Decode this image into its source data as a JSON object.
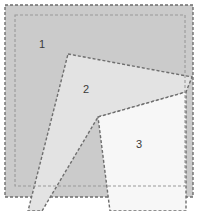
{
  "canvas": {
    "width": 198,
    "height": 211,
    "background_color": "#ffffff"
  },
  "diagram": {
    "type": "geometric-region-overlay"
  },
  "colors": {
    "page_background": "#ffffff",
    "outer_frame_fill": "#cccccc",
    "inner_frame_fill": "#cdcdcd",
    "region1_fill": "#cbcbcb",
    "region2_fill": "#e3e3e3",
    "region3_fill": "#f7f7f7",
    "dash_stroke": "#6e6e6e",
    "dash_stroke_light": "#9a9a9a",
    "label_text": "#3a3a3a"
  },
  "shapes": {
    "outer_frame": {
      "name": "outer-dashed-rectangle",
      "x": 5,
      "y": 5,
      "width": 188,
      "height": 192,
      "fill": "#cbcbcb",
      "stroke": "#6e6e6e",
      "stroke_width": 1.4,
      "dash_pattern": "3,2"
    },
    "inner_frame": {
      "name": "inner-dashed-rectangle",
      "x": 15,
      "y": 15,
      "width": 170,
      "height": 171,
      "fill": "none",
      "stroke": "#9a9a9a",
      "stroke_width": 1.1,
      "dash_pattern": "3,2"
    },
    "region2": {
      "name": "region-2-polygon",
      "points": "68,54 192,77 186,92 98,117 42,211 28,211",
      "fill": "#e3e3e3",
      "stroke": "#6e6e6e",
      "stroke_width": 1.4,
      "dash_pattern": "3,2"
    },
    "region3": {
      "name": "region-3-polygon",
      "points": "98,117 186,92 186,211 110,211",
      "fill": "#f7f7f7",
      "stroke": "#6e6e6e",
      "stroke_width": 1.4,
      "dash_pattern": "3,2"
    }
  },
  "labels": [
    {
      "id": "region-1",
      "text": "1",
      "x": 42,
      "y": 45
    },
    {
      "id": "region-2",
      "text": "2",
      "x": 86,
      "y": 90
    },
    {
      "id": "region-3",
      "text": "3",
      "x": 139,
      "y": 145
    }
  ]
}
